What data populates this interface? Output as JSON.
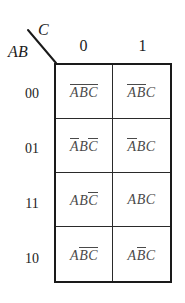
{
  "header": {
    "col_var": "C",
    "row_var": "AB",
    "corner_divider": "diagonal-slash"
  },
  "columns": [
    {
      "label": "0"
    },
    {
      "label": "1"
    }
  ],
  "rows": [
    {
      "label": "00"
    },
    {
      "label": "01"
    },
    {
      "label": "11"
    },
    {
      "label": "10"
    }
  ],
  "cells": [
    {
      "row": "00",
      "col": "0",
      "text": "A'B'C'",
      "literals": [
        {
          "name": "A",
          "negated": true
        },
        {
          "name": "B",
          "negated": true
        },
        {
          "name": "C",
          "negated": true
        }
      ]
    },
    {
      "row": "00",
      "col": "1",
      "text": "A'B'C",
      "literals": [
        {
          "name": "A",
          "negated": true
        },
        {
          "name": "B",
          "negated": true
        },
        {
          "name": "C",
          "negated": false
        }
      ]
    },
    {
      "row": "01",
      "col": "0",
      "text": "A'BC'",
      "literals": [
        {
          "name": "A",
          "negated": true
        },
        {
          "name": "B",
          "negated": false
        },
        {
          "name": "C",
          "negated": true
        }
      ]
    },
    {
      "row": "01",
      "col": "1",
      "text": "A'BC",
      "literals": [
        {
          "name": "A",
          "negated": true
        },
        {
          "name": "B",
          "negated": false
        },
        {
          "name": "C",
          "negated": false
        }
      ]
    },
    {
      "row": "11",
      "col": "0",
      "text": "ABC'",
      "literals": [
        {
          "name": "A",
          "negated": false
        },
        {
          "name": "B",
          "negated": false
        },
        {
          "name": "C",
          "negated": true
        }
      ]
    },
    {
      "row": "11",
      "col": "1",
      "text": "ABC",
      "literals": [
        {
          "name": "A",
          "negated": false
        },
        {
          "name": "B",
          "negated": false
        },
        {
          "name": "C",
          "negated": false
        }
      ]
    },
    {
      "row": "10",
      "col": "0",
      "text": "AB'C'",
      "literals": [
        {
          "name": "A",
          "negated": false
        },
        {
          "name": "B",
          "negated": true
        },
        {
          "name": "C",
          "negated": true
        }
      ]
    },
    {
      "row": "10",
      "col": "1",
      "text": "AB'C",
      "literals": [
        {
          "name": "A",
          "negated": false
        },
        {
          "name": "B",
          "negated": true
        },
        {
          "name": "C",
          "negated": false
        }
      ]
    }
  ],
  "colors": {
    "border": "#1a1a1a",
    "inner_border": "#2a2a2a",
    "text": "#1c1c1c",
    "cell_text": "#4a4a4a",
    "background": "#ffffff"
  }
}
